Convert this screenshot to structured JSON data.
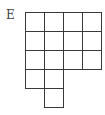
{
  "figure": {
    "label": "E",
    "grid": {
      "origin": [
        25,
        12
      ],
      "cell_size": 19,
      "line_color": "#3a3a3a",
      "rows": [
        {
          "row": 0,
          "columns": [
            0,
            1,
            2,
            3
          ]
        },
        {
          "row": 1,
          "columns": [
            0,
            1,
            2,
            3
          ]
        },
        {
          "row": 2,
          "columns": [
            0,
            1,
            2,
            3
          ]
        },
        {
          "row": 3,
          "columns": [
            0,
            1
          ]
        },
        {
          "row": 4,
          "columns": [
            1
          ]
        }
      ],
      "total_cells": 15
    }
  }
}
